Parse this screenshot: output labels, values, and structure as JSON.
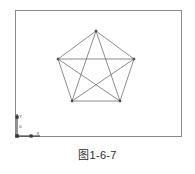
{
  "figure": {
    "caption_symbol": "图",
    "caption_index": "1-6-7",
    "caption_full": "图 1-6-7"
  },
  "viewport": {
    "background_color": "#ffffff",
    "border_color": "#8a8a8a",
    "border": {
      "x": 15.5,
      "y": 10.5,
      "width": 166,
      "height": 126
    }
  },
  "ucs_icon": {
    "label_x": "X",
    "label_y": "Y",
    "origin_label": "0",
    "color": "#3a3a3a",
    "origin": {
      "x": 17,
      "y": 136
    },
    "x_axis_end": {
      "x": 40,
      "y": 136
    },
    "y_axis_end": {
      "x": 17,
      "y": 114
    }
  },
  "drawing": {
    "name": "pentagon-with-diagonals",
    "stroke_color": "#6e6e6e",
    "vertex_color": "#4a4a4a",
    "stroke_width": 0.8,
    "vertices": [
      {
        "id": "A",
        "x": 96,
        "y": 31
      },
      {
        "id": "B",
        "x": 134,
        "y": 59
      },
      {
        "id": "C",
        "x": 120,
        "y": 101
      },
      {
        "id": "D",
        "x": 72,
        "y": 101
      },
      {
        "id": "E",
        "x": 58,
        "y": 59
      }
    ],
    "edges": [
      [
        "A",
        "B"
      ],
      [
        "B",
        "C"
      ],
      [
        "C",
        "D"
      ],
      [
        "D",
        "E"
      ],
      [
        "E",
        "A"
      ],
      [
        "A",
        "C"
      ],
      [
        "A",
        "D"
      ],
      [
        "B",
        "D"
      ],
      [
        "B",
        "E"
      ],
      [
        "C",
        "E"
      ]
    ]
  }
}
